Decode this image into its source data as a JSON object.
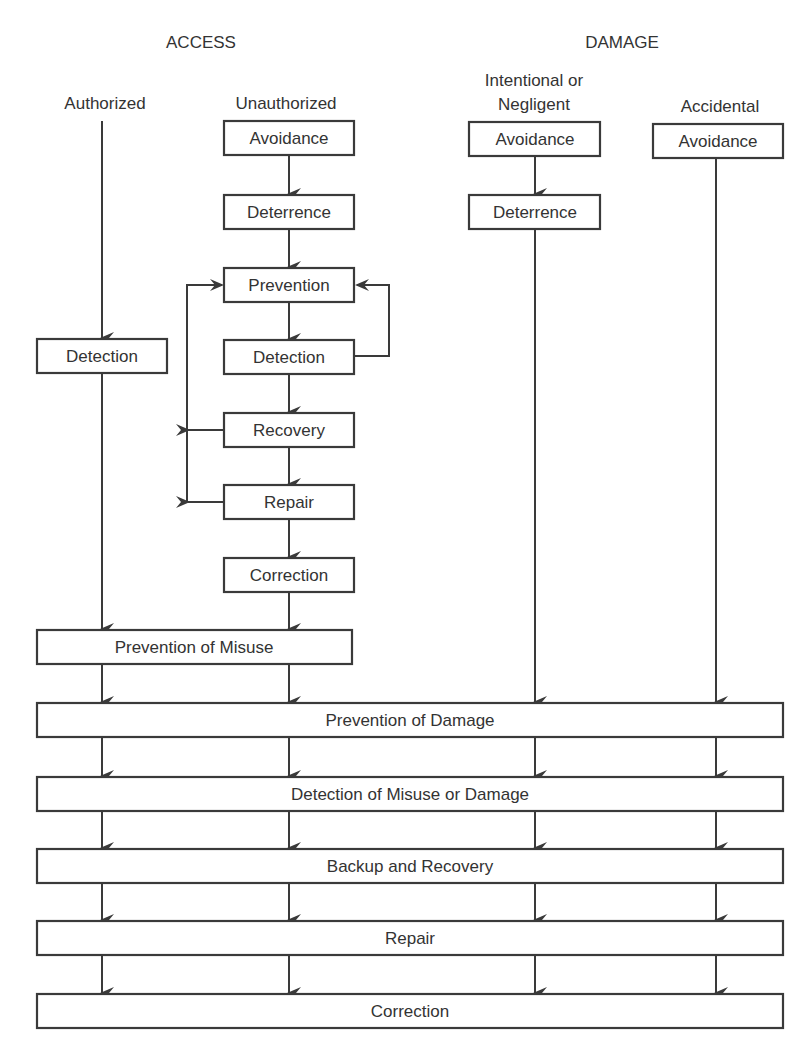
{
  "diagram": {
    "headers": {
      "access": "ACCESS",
      "damage": "DAMAGE"
    },
    "columns": {
      "authorized": "Authorized",
      "unauthorized": "Unauthorized",
      "intentional_line1": "Intentional or",
      "intentional_line2": "Negligent",
      "accidental": "Accidental"
    },
    "authorized_boxes": {
      "detection": "Detection"
    },
    "unauthorized_boxes": {
      "avoidance": "Avoidance",
      "deterrence": "Deterrence",
      "prevention": "Prevention",
      "detection": "Detection",
      "recovery": "Recovery",
      "repair": "Repair",
      "correction": "Correction"
    },
    "intentional_boxes": {
      "avoidance": "Avoidance",
      "deterrence": "Deterrence"
    },
    "accidental_boxes": {
      "avoidance": "Avoidance"
    },
    "access_merge": {
      "prevention_of_misuse": "Prevention of Misuse"
    },
    "common_stages": {
      "prevention_of_damage": "Prevention of Damage",
      "detection_of_misuse_or_damage": "Detection of Misuse or Damage",
      "backup_and_recovery": "Backup and Recovery",
      "repair": "Repair",
      "correction": "Correction"
    },
    "colors": {
      "line": "#3a3a3a",
      "text": "#333333",
      "background": "#ffffff"
    }
  }
}
